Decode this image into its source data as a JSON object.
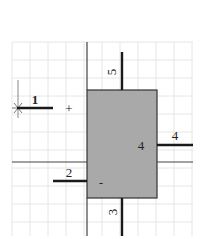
{
  "diagram": {
    "colors": {
      "background": "#ffffff",
      "grid": "#e6e6e6",
      "block_fill": "#a9a9a9",
      "block_stroke": "#333333",
      "thick_line": "#1a1a1a",
      "thin_line": "#444444"
    },
    "grid": {
      "x0": 12,
      "y0": 42,
      "x1": 193,
      "y1": 236,
      "step": 18
    },
    "block": {
      "x": 87,
      "y": 90,
      "width": 70,
      "height": 108
    },
    "pins": [
      {
        "id": "1",
        "label": "1",
        "orientation": "horizontal",
        "side": "left-outer"
      },
      {
        "id": "2",
        "label": "2",
        "orientation": "horizontal",
        "side": "left"
      },
      {
        "id": "3",
        "label": "3",
        "orientation": "vertical",
        "side": "bottom"
      },
      {
        "id": "4",
        "label": "4",
        "orientation": "horizontal",
        "side": "right"
      },
      {
        "id": "5",
        "label": "5",
        "orientation": "vertical",
        "side": "top"
      }
    ],
    "inner_labels": {
      "plus": "+",
      "minus": "-",
      "four": "4"
    },
    "markers": {
      "origin": "asterisk"
    }
  }
}
